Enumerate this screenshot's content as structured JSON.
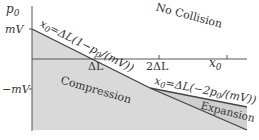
{
  "diagram": {
    "axes": {
      "y_label": "p",
      "y_label_sub": "0",
      "x_label": "x",
      "x_label_sub": "0",
      "y_ticks": [
        {
          "label": "mV",
          "position": "top"
        },
        {
          "label": "−mV",
          "position": "bottom"
        }
      ],
      "x_ticks": [
        {
          "label": "ΔL"
        },
        {
          "label": "2ΔL"
        },
        {
          "label": "x₀"
        }
      ]
    },
    "regions": {
      "no_collision": "No Collision",
      "compression": "Compression",
      "expansion": "Expansion"
    },
    "boundaries": {
      "upper": "x₀=ΔL(1−p₀/(mV))",
      "lower": "x₀=ΔL(−2p₀/(mV))"
    },
    "colors": {
      "shade": "#d9d9d9",
      "line": "#444444",
      "axis": "#555555"
    }
  },
  "text": {
    "tick_mV": "mV",
    "tick_neg_mV": "−mV",
    "tick_dL": "ΔL",
    "tick_2dL": "2ΔL",
    "axis_x": "x",
    "axis_x_sub": "0",
    "axis_y": "p",
    "axis_y_sub": "0",
    "no_collision": "No Collision",
    "compression": "Compression",
    "expansion": "Expansion",
    "eq_upper_a": "x",
    "eq_upper_sub": "0",
    "eq_upper_b": "=ΔL(1−p",
    "eq_upper_sub2": "0",
    "eq_upper_c": "/(mV))",
    "eq_lower_a": "x",
    "eq_lower_sub": "0",
    "eq_lower_b": "=ΔL(−2p",
    "eq_lower_sub2": "0",
    "eq_lower_c": "/(mV))"
  }
}
